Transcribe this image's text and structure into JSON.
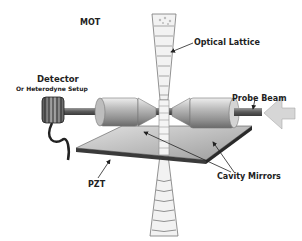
{
  "diagram": {
    "labels": {
      "mot": "MOT",
      "optical_lattice": "Optical Lattice",
      "detector": "Detector",
      "heterodyne": "Or Heterodyne Setup",
      "probe_beam": "Probe Beam",
      "pzt": "PZT",
      "cavity_mirrors": "Cavity Mirrors"
    },
    "colors": {
      "background": "#ffffff",
      "text": "#222222",
      "metal_light": "#d8d8d8",
      "metal_mid": "#a8a8a8",
      "metal_dark": "#505050",
      "plate_top": "#c4c4c4",
      "plate_edge": "#3a3a3a",
      "arrow_fill": "#d6d6d6"
    }
  }
}
